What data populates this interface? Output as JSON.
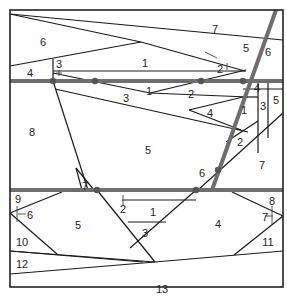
{
  "diagram": {
    "type": "region-partition",
    "frame": {
      "x": 10,
      "y": 10,
      "w": 273,
      "h": 277,
      "stroke": "#222222"
    },
    "colors": {
      "line": "#1a1a1a",
      "thick_line": "#6e6e6e",
      "dot": "#555555",
      "background": "#ffffff"
    },
    "thick_lines": [
      {
        "id": "upper-horizontal",
        "x1": 10,
        "y1": 81,
        "x2": 283,
        "y2": 81
      },
      {
        "id": "lower-horizontal",
        "x1": 10,
        "y1": 190,
        "x2": 283,
        "y2": 190
      },
      {
        "id": "diagonal",
        "x1": 276,
        "y1": 10,
        "x2": 212,
        "y2": 190
      }
    ],
    "dots": [
      {
        "x": 53,
        "y": 81
      },
      {
        "x": 95,
        "y": 81
      },
      {
        "x": 201,
        "y": 81
      },
      {
        "x": 243,
        "y": 81
      },
      {
        "x": 97,
        "y": 190
      },
      {
        "x": 196,
        "y": 190
      },
      {
        "x": 218,
        "y": 170
      }
    ],
    "thin_lines": [
      {
        "x1": 10,
        "y1": 14,
        "x2": 283,
        "y2": 40,
        "note": "top slanted boundary region 6/7 upper"
      },
      {
        "x1": 10,
        "y1": 14,
        "x2": 141,
        "y2": 42
      },
      {
        "x1": 141,
        "y1": 42,
        "x2": 10,
        "y2": 66
      },
      {
        "x1": 141,
        "y1": 42,
        "x2": 245,
        "y2": 71
      },
      {
        "x1": 53,
        "y1": 59,
        "x2": 53,
        "y2": 81
      },
      {
        "x1": 53,
        "y1": 71,
        "x2": 246,
        "y2": 71
      },
      {
        "x1": 53,
        "y1": 73,
        "x2": 150,
        "y2": 93
      },
      {
        "x1": 150,
        "y1": 93,
        "x2": 246,
        "y2": 70
      },
      {
        "x1": 55,
        "y1": 89,
        "x2": 248,
        "y2": 132
      },
      {
        "x1": 150,
        "y1": 93,
        "x2": 248,
        "y2": 97
      },
      {
        "x1": 189,
        "y1": 110,
        "x2": 243,
        "y2": 97
      },
      {
        "x1": 189,
        "y1": 110,
        "x2": 241,
        "y2": 130
      },
      {
        "x1": 243,
        "y1": 89,
        "x2": 283,
        "y2": 89
      },
      {
        "x1": 243,
        "y1": 97,
        "x2": 258,
        "y2": 97
      },
      {
        "x1": 258,
        "y1": 81,
        "x2": 258,
        "y2": 153
      },
      {
        "x1": 268,
        "y1": 81,
        "x2": 268,
        "y2": 138
      },
      {
        "x1": 258,
        "y1": 121,
        "x2": 226,
        "y2": 142
      },
      {
        "x1": 283,
        "y1": 113,
        "x2": 198,
        "y2": 190
      },
      {
        "x1": 53,
        "y1": 81,
        "x2": 88,
        "y2": 190
      },
      {
        "x1": 76,
        "y1": 168,
        "x2": 94,
        "y2": 190
      },
      {
        "x1": 76,
        "y1": 168,
        "x2": 82,
        "y2": 190
      },
      {
        "x1": 97,
        "y1": 190,
        "x2": 155,
        "y2": 262
      },
      {
        "x1": 196,
        "y1": 190,
        "x2": 130,
        "y2": 248
      },
      {
        "x1": 122,
        "y1": 200,
        "x2": 196,
        "y2": 200
      },
      {
        "x1": 128,
        "y1": 222,
        "x2": 166,
        "y2": 222
      },
      {
        "x1": 62,
        "y1": 192,
        "x2": 10,
        "y2": 213
      },
      {
        "x1": 10,
        "y1": 213,
        "x2": 57,
        "y2": 254
      },
      {
        "x1": 10,
        "y1": 251,
        "x2": 155,
        "y2": 262
      },
      {
        "x1": 155,
        "y1": 262,
        "x2": 10,
        "y2": 274
      },
      {
        "x1": 10,
        "y1": 251,
        "x2": 143,
        "y2": 262
      },
      {
        "x1": 155,
        "y1": 262,
        "x2": 283,
        "y2": 251
      },
      {
        "x1": 232,
        "y1": 192,
        "x2": 283,
        "y2": 216
      },
      {
        "x1": 283,
        "y1": 216,
        "x2": 234,
        "y2": 255
      }
    ],
    "ticks": [
      {
        "x1": 56,
        "y1": 73,
        "x2": 62,
        "y2": 73
      },
      {
        "x1": 59,
        "y1": 70,
        "x2": 59,
        "y2": 76
      },
      {
        "x1": 18,
        "y1": 214,
        "x2": 26,
        "y2": 214
      },
      {
        "x1": 17,
        "y1": 206,
        "x2": 17,
        "y2": 222
      },
      {
        "x1": 265,
        "y1": 216,
        "x2": 273,
        "y2": 216
      },
      {
        "x1": 272,
        "y1": 206,
        "x2": 272,
        "y2": 224
      },
      {
        "x1": 123,
        "y1": 195,
        "x2": 123,
        "y2": 205
      },
      {
        "x1": 227,
        "y1": 63,
        "x2": 227,
        "y2": 70
      },
      {
        "x1": 205,
        "y1": 52,
        "x2": 217,
        "y2": 58
      }
    ],
    "labels": [
      {
        "text": "6",
        "x": 43,
        "y": 46
      },
      {
        "text": "7",
        "x": 215,
        "y": 33
      },
      {
        "text": "5",
        "x": 246,
        "y": 52
      },
      {
        "text": "6",
        "x": 268,
        "y": 56
      },
      {
        "text": "1",
        "x": 145,
        "y": 67
      },
      {
        "text": "2",
        "x": 220,
        "y": 73
      },
      {
        "text": "3",
        "x": 59,
        "y": 68
      },
      {
        "text": "4",
        "x": 30,
        "y": 77
      },
      {
        "text": "1",
        "x": 149,
        "y": 95
      },
      {
        "text": "2",
        "x": 191,
        "y": 98
      },
      {
        "text": "3",
        "x": 126,
        "y": 102
      },
      {
        "text": "4",
        "x": 210,
        "y": 117
      },
      {
        "text": "4",
        "x": 257,
        "y": 92
      },
      {
        "text": "1",
        "x": 244,
        "y": 114
      },
      {
        "text": "3",
        "x": 263,
        "y": 110
      },
      {
        "text": "5",
        "x": 276,
        "y": 104
      },
      {
        "text": "8",
        "x": 32,
        "y": 136
      },
      {
        "text": "5",
        "x": 148,
        "y": 154
      },
      {
        "text": "2",
        "x": 240,
        "y": 146
      },
      {
        "text": "7",
        "x": 262,
        "y": 169
      },
      {
        "text": "6",
        "x": 202,
        "y": 177
      },
      {
        "text": "7",
        "x": 85,
        "y": 190
      },
      {
        "text": "9",
        "x": 18,
        "y": 203
      },
      {
        "text": "6",
        "x": 30,
        "y": 219
      },
      {
        "text": "5",
        "x": 78,
        "y": 229
      },
      {
        "text": "2",
        "x": 123,
        "y": 213
      },
      {
        "text": "1",
        "x": 153,
        "y": 216
      },
      {
        "text": "3",
        "x": 145,
        "y": 237
      },
      {
        "text": "4",
        "x": 218,
        "y": 228
      },
      {
        "text": "8",
        "x": 272,
        "y": 205
      },
      {
        "text": "7",
        "x": 265,
        "y": 221
      },
      {
        "text": "10",
        "x": 22,
        "y": 246
      },
      {
        "text": "11",
        "x": 268,
        "y": 246
      },
      {
        "text": "12",
        "x": 22,
        "y": 268
      },
      {
        "text": "13",
        "x": 162,
        "y": 293
      }
    ]
  }
}
